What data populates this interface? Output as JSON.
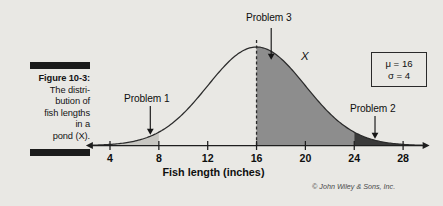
{
  "figure": {
    "caption_label": "Figure 10-3:",
    "caption_lines": [
      "The distri-",
      "bution of",
      "fish lengths",
      "in a",
      "pond (X)."
    ],
    "copyright": "© John Wiley & Sons, Inc."
  },
  "annotations": {
    "problem1": "Problem 1",
    "problem2": "Problem 2",
    "problem3": "Problem 3",
    "variable": "X"
  },
  "stats": {
    "mu": "μ = 16",
    "sigma": "σ = 4"
  },
  "colors": {
    "background": "#e9e8e4",
    "curve": "#2b2b2b",
    "axis": "#1e1e1e",
    "shade_light": "#c8c7c2",
    "shade_medium": "#8d8d8d",
    "shade_dark": "#3a3a3a",
    "caption_bar": "#1b1b1b"
  },
  "chart_data": {
    "type": "area",
    "title": "",
    "xlabel": "Fish length (inches)",
    "ylabel": "",
    "distribution": "normal",
    "mu": 16,
    "sigma": 4,
    "xlim": [
      2.6,
      29.6
    ],
    "xticks": [
      4,
      8,
      12,
      16,
      20,
      24,
      28
    ],
    "xtick_labels": [
      "4",
      "8",
      "12",
      "16",
      "20",
      "24",
      "28"
    ],
    "grid": false,
    "legend": null,
    "shaded_regions": [
      {
        "name": "Problem 1",
        "from": 2.6,
        "to": 8,
        "color": "#c8c7c2"
      },
      {
        "name": "Problem 3",
        "from": 16,
        "to": 24,
        "color": "#8d8d8d"
      },
      {
        "name": "Problem 2",
        "from": 24,
        "to": 29.6,
        "color": "#3a3a3a"
      }
    ],
    "vertical_lines": [
      {
        "x": 16,
        "style": "dashed",
        "color": "#2b2b2b"
      }
    ],
    "annotations": [
      {
        "text": "Problem 1",
        "points_to_x": 7.3,
        "arrow": "down"
      },
      {
        "text": "Problem 2",
        "points_to_x": 25.7,
        "arrow": "down"
      },
      {
        "text": "Problem 3",
        "points_to_x": 17.2,
        "arrow": "down"
      },
      {
        "text": "X",
        "points_to_x": 20.2,
        "arrow": "none"
      }
    ],
    "curve_points_x": [
      2.6,
      3.0,
      3.5,
      4.0,
      4.5,
      5.0,
      5.5,
      6.0,
      6.5,
      7.0,
      7.5,
      8.0,
      8.5,
      9.0,
      9.5,
      10.0,
      10.5,
      11.0,
      11.5,
      12.0,
      12.5,
      13.0,
      13.5,
      14.0,
      14.5,
      15.0,
      15.5,
      16.0,
      16.5,
      17.0,
      17.5,
      18.0,
      18.5,
      19.0,
      19.5,
      20.0,
      20.5,
      21.0,
      21.5,
      22.0,
      22.5,
      23.0,
      23.5,
      24.0,
      24.5,
      25.0,
      25.5,
      26.0,
      26.5,
      27.0,
      27.5,
      28.0,
      28.5,
      29.0,
      29.6
    ],
    "curve_points_y": [
      0.004,
      0.006,
      0.009,
      0.013,
      0.018,
      0.024,
      0.032,
      0.04,
      0.05,
      0.061,
      0.072,
      0.086,
      0.099,
      0.113,
      0.127,
      0.141,
      0.155,
      0.168,
      0.18,
      0.19,
      0.199,
      0.206,
      0.212,
      0.216,
      0.219,
      0.22,
      0.22,
      0.22,
      0.22,
      0.22,
      0.219,
      0.216,
      0.212,
      0.206,
      0.199,
      0.19,
      0.18,
      0.168,
      0.155,
      0.141,
      0.127,
      0.113,
      0.099,
      0.086,
      0.072,
      0.061,
      0.05,
      0.04,
      0.032,
      0.024,
      0.018,
      0.013,
      0.009,
      0.006,
      0.004
    ]
  }
}
